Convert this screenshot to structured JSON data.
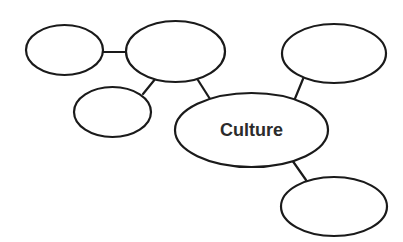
{
  "diagram": {
    "type": "concept-map",
    "canvas": {
      "width": 403,
      "height": 242,
      "background": "#ffffff"
    },
    "style": {
      "node_stroke": "#1a1a1a",
      "node_fill": "#ffffff",
      "node_stroke_width": 2.2,
      "connector_stroke": "#1a1a1a",
      "connector_stroke_width": 2.2,
      "label_color": "#2b2b2b",
      "label_font_size": 18
    },
    "nodes": [
      {
        "id": "node-center-culture",
        "name": "center-node-culture",
        "label": "Culture",
        "cx": 251.5,
        "cy": 130,
        "rx": 76.5,
        "ry": 37
      },
      {
        "id": "node-top-left",
        "name": "node-top-left",
        "label": "",
        "cx": 64.5,
        "cy": 50,
        "rx": 38.5,
        "ry": 25
      },
      {
        "id": "node-top-middle",
        "name": "node-top-middle",
        "label": "",
        "cx": 175.5,
        "cy": 51.5,
        "rx": 49.5,
        "ry": 30.5
      },
      {
        "id": "node-left-lower",
        "name": "node-left-lower",
        "label": "",
        "cx": 112.5,
        "cy": 112,
        "rx": 38.5,
        "ry": 25
      },
      {
        "id": "node-top-right",
        "name": "node-top-right",
        "label": "",
        "cx": 334,
        "cy": 53.5,
        "rx": 52,
        "ry": 29.5
      },
      {
        "id": "node-bottom-right",
        "name": "node-bottom-right",
        "label": "",
        "cx": 334,
        "cy": 206.5,
        "rx": 53,
        "ry": 29.5
      }
    ],
    "connectors": [
      {
        "id": "link-topleft-topmiddle",
        "name": "connector-top-left-to-top-middle",
        "from": "node-top-left",
        "to": "node-top-middle",
        "x1": 102,
        "y1": 52,
        "x2": 128,
        "y2": 52
      },
      {
        "id": "link-topmiddle-leftlower",
        "name": "connector-top-middle-to-left-lower",
        "from": "node-top-middle",
        "to": "node-left-lower",
        "x1": 156,
        "y1": 78,
        "x2": 143,
        "y2": 94
      },
      {
        "id": "link-topmiddle-center",
        "name": "connector-top-middle-to-center",
        "from": "node-top-middle",
        "to": "node-center-culture",
        "x1": 196,
        "y1": 77,
        "x2": 210,
        "y2": 99
      },
      {
        "id": "link-topright-center",
        "name": "connector-top-right-to-center",
        "from": "node-top-right",
        "to": "node-center-culture",
        "x1": 303,
        "y1": 79,
        "x2": 294,
        "y2": 101
      },
      {
        "id": "link-center-bottomright",
        "name": "connector-center-to-bottom-right",
        "from": "node-center-culture",
        "to": "node-bottom-right",
        "x1": 292,
        "y1": 160,
        "x2": 306,
        "y2": 180
      }
    ]
  }
}
